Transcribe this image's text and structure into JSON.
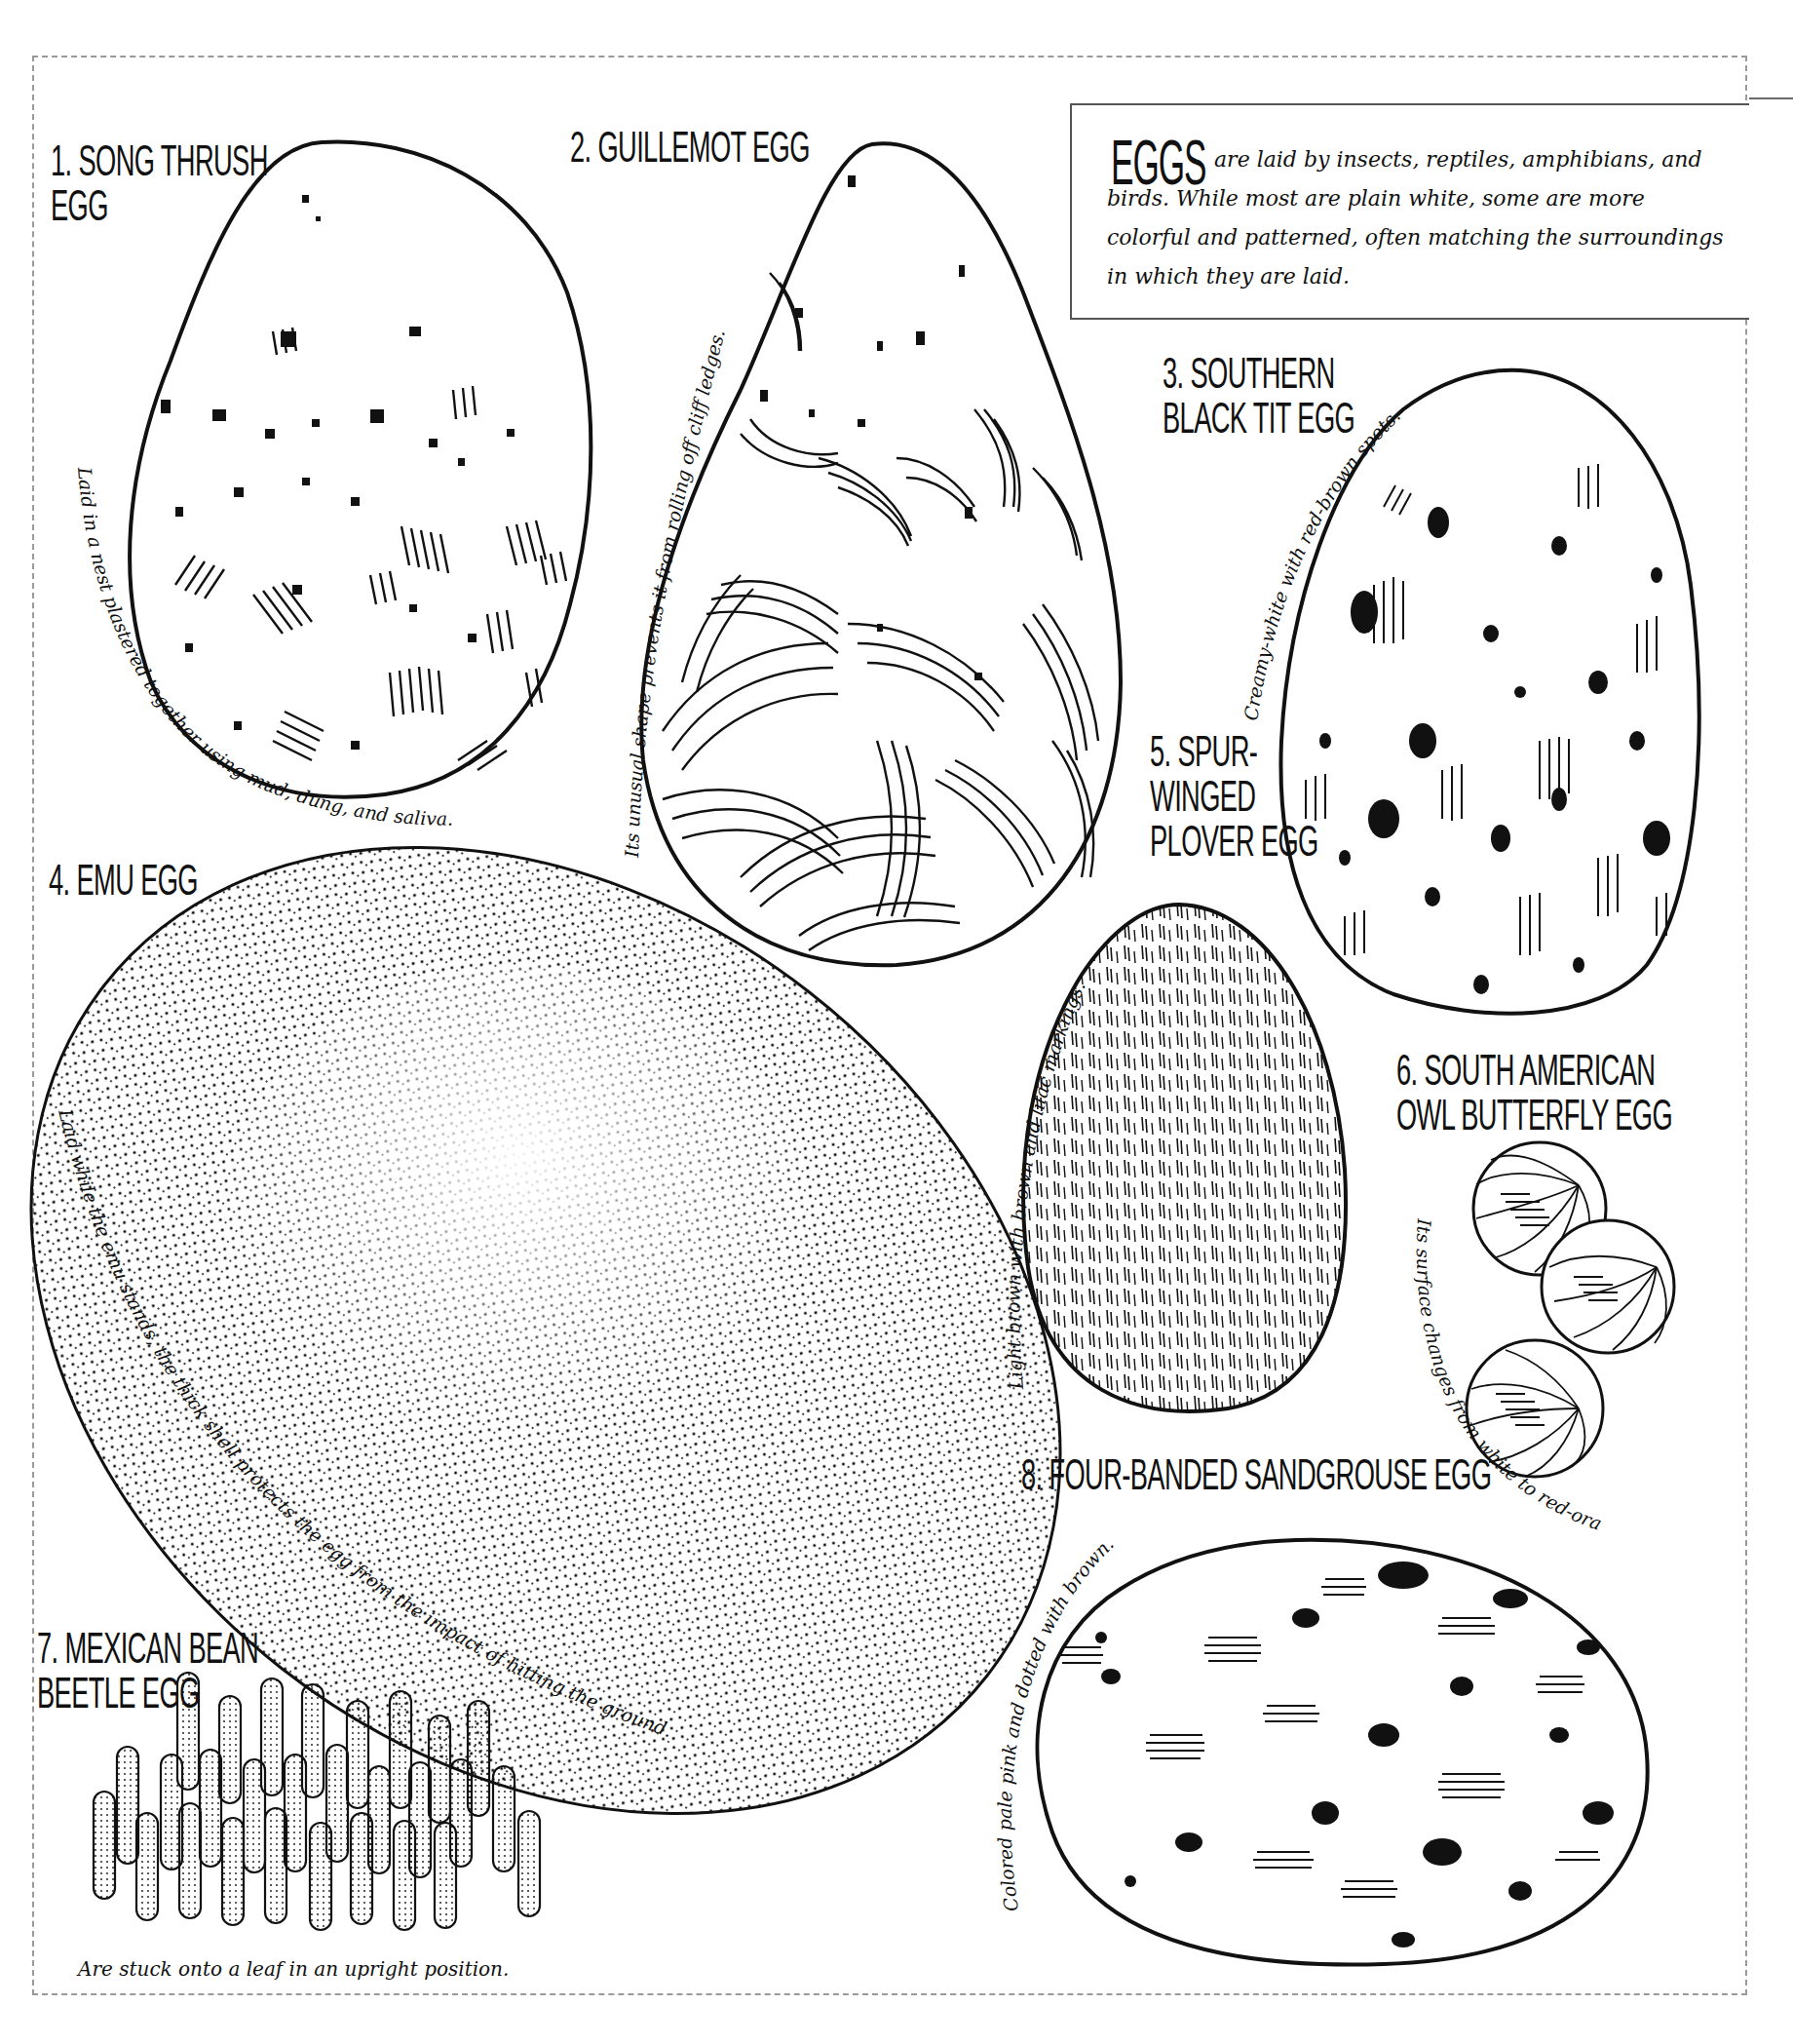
{
  "intro": {
    "title": "EGGS",
    "text": "are laid by insects, reptiles, amphibians, and birds. While most are plain white, some are more colorful and patterned, often matching the surroundings in which they are laid."
  },
  "eggs": [
    {
      "number": "1.",
      "name": "Song thrush egg",
      "label_line1": "1. Song thrush",
      "label_line2": "egg",
      "caption": "Laid in a nest plastered together using mud, dung, and saliva."
    },
    {
      "number": "2.",
      "name": "Guillemot egg",
      "label_line1": "2. Guillemot egg",
      "caption": "Its unusual shape prevents it from rolling off cliff ledges."
    },
    {
      "number": "3.",
      "name": "Southern black tit egg",
      "label_line1": "3. Southern",
      "label_line2": "black tit egg",
      "caption": "Creamy-white with red-brown spots."
    },
    {
      "number": "4.",
      "name": "Emu egg",
      "label_line1": "4. Emu egg",
      "caption": "Laid while the emu stands, the thick shell protects the egg from the impact of hitting the ground."
    },
    {
      "number": "5.",
      "name": "Spur-winged plover egg",
      "label_line1": "5. Spur-",
      "label_line2": "winged",
      "label_line3": "plover egg",
      "caption": "Light brown with brown and lilac markings."
    },
    {
      "number": "6.",
      "name": "South American owl butterfly egg",
      "label_line1": "6. South American",
      "label_line2": "owl butterfly egg",
      "caption": "Its surface changes from white to red-orange."
    },
    {
      "number": "7.",
      "name": "Mexican bean beetle egg",
      "label_line1": "7. Mexican bean",
      "label_line2": "beetle egg",
      "caption": "Are stuck onto a leaf in an upright position."
    },
    {
      "number": "8.",
      "name": "Four-banded sandgrouse egg",
      "label_line1": "8. Four-banded sandgrouse egg",
      "caption": "Colored pale pink and dotted with brown."
    }
  ],
  "colors": {
    "ink": "#111111",
    "cutline": "#9a9a9a",
    "paper": "#ffffff"
  }
}
